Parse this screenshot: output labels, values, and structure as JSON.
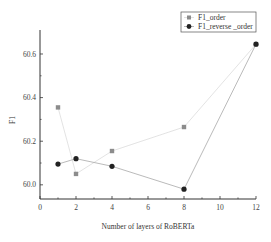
{
  "chart_data": {
    "type": "line",
    "title": "",
    "xlabel": "Number of layers of RoBERTa",
    "ylabel": "F1",
    "x": [
      1,
      2,
      4,
      8,
      12
    ],
    "series": [
      {
        "name": "F1_order",
        "marker": "square",
        "marker_color": "#8c8c8c",
        "line_color": "#dcdcdc",
        "values": [
          60.355,
          60.05,
          60.155,
          60.265,
          60.645
        ]
      },
      {
        "name": "F1_reverse _order",
        "marker": "circle",
        "marker_color": "#222222",
        "line_color": "#a8a8a8",
        "values": [
          60.095,
          60.12,
          60.085,
          59.98,
          60.645
        ]
      }
    ],
    "xlim": [
      0,
      12
    ],
    "ylim": [
      59.935,
      60.71
    ],
    "xticks": [
      0,
      2,
      4,
      6,
      8,
      10,
      12
    ],
    "xticks_minor": [
      1,
      3,
      5,
      7,
      9,
      11
    ],
    "yticks": [
      60.0,
      60.2,
      60.4,
      60.6
    ],
    "yticks_minor": [
      60.1,
      60.3,
      60.5
    ],
    "ytick_labels": [
      "60.0",
      "60.2",
      "60.4",
      "60.6"
    ],
    "xtick_labels": [
      "0",
      "2",
      "4",
      "6",
      "8",
      "10",
      "12"
    ],
    "grid": false,
    "legend_position": "upper right"
  }
}
